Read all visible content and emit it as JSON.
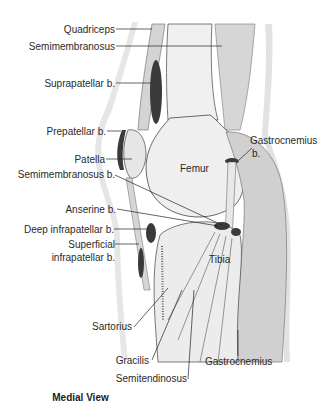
{
  "diagram": {
    "title": "Medial View",
    "labels_left": [
      {
        "id": "quadriceps",
        "text": "Quadriceps"
      },
      {
        "id": "semimembranosus",
        "text": "Semimembranosus"
      },
      {
        "id": "suprapatellar",
        "text": "Suprapatellar b."
      },
      {
        "id": "prepatellar",
        "text": "Prepatellar b."
      },
      {
        "id": "patella",
        "text": "Patella"
      },
      {
        "id": "semimembranosus_b",
        "text": "Semimembranosus b."
      },
      {
        "id": "anserine",
        "text": "Anserine b."
      },
      {
        "id": "deep_infrapatellar",
        "text": "Deep infrapatellar b."
      },
      {
        "id": "superficial_infrapatellar_1",
        "text": "Superficial"
      },
      {
        "id": "superficial_infrapatellar_2",
        "text": "infrapatellar b."
      },
      {
        "id": "sartorius",
        "text": "Sartorius"
      },
      {
        "id": "gracilis",
        "text": "Gracilis"
      },
      {
        "id": "semitendinosus",
        "text": "Semitendinosus"
      }
    ],
    "labels_inner": [
      {
        "id": "femur",
        "text": "Femur"
      },
      {
        "id": "tibia",
        "text": "Tibia"
      }
    ],
    "labels_right": [
      {
        "id": "gastrocnemius_b_1",
        "text": "Gastrocnemius"
      },
      {
        "id": "gastrocnemius_b_2",
        "text": "b."
      },
      {
        "id": "gastrocnemius",
        "text": "Gastrocnemius"
      }
    ],
    "colors": {
      "bursa": "#3a3a3a",
      "muscle": "#d2d2d2",
      "bone": "#efefef",
      "skin": "#e4e4e4",
      "outline": "#444444"
    }
  }
}
